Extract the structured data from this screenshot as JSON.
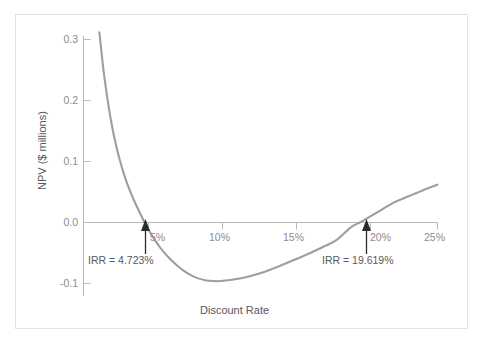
{
  "chart_data": {
    "type": "line",
    "title": "",
    "subtitle": "",
    "xlabel": "Discount Rate",
    "ylabel": "NPV ($ millions)",
    "xlim": [
      1.5,
      25
    ],
    "ylim": [
      -0.12,
      0.32
    ],
    "xticks": [
      5,
      10,
      15,
      20,
      25
    ],
    "xtick_labels": [
      "5%",
      "10%",
      "15%",
      "20%",
      "25%"
    ],
    "yticks": [
      -0.1,
      0.0,
      0.1,
      0.2,
      0.3
    ],
    "ytick_labels": [
      "-0.1",
      "0.0",
      "0.1",
      "0.2",
      "0.3"
    ],
    "grid": false,
    "legend": null,
    "series": [
      {
        "name": "NPV profile",
        "color": "#a59aa0",
        "x": [
          1.6,
          1.9,
          2.2,
          2.5,
          2.8,
          3.1,
          3.4,
          3.7,
          4.0,
          4.3,
          4.723,
          5.0,
          5.5,
          6.0,
          6.5,
          7.0,
          7.5,
          8.0,
          8.5,
          9.0,
          9.5,
          10.0,
          11.0,
          12.0,
          13.0,
          14.0,
          15.0,
          16.0,
          17.0,
          18.0,
          19.0,
          19.619,
          20.0,
          21.0,
          22.0,
          23.0,
          24.0,
          25.0
        ],
        "y": [
          0.312,
          0.247,
          0.196,
          0.155,
          0.122,
          0.095,
          0.072,
          0.053,
          0.036,
          0.021,
          0.0,
          -0.012,
          -0.031,
          -0.047,
          -0.06,
          -0.071,
          -0.08,
          -0.087,
          -0.092,
          -0.095,
          -0.096,
          -0.096,
          -0.093,
          -0.088,
          -0.081,
          -0.072,
          -0.062,
          -0.052,
          -0.041,
          -0.029,
          -0.008,
          0.0,
          0.005,
          0.019,
          0.033,
          0.043,
          0.053,
          0.062
        ]
      }
    ],
    "annotations": [
      {
        "id": "irr-low",
        "text": "IRR = 4.723%",
        "x": 4.723,
        "y": 0.0,
        "arrow": true
      },
      {
        "id": "irr-high",
        "text": "IRR = 19.619%",
        "x": 19.619,
        "y": 0.0,
        "arrow": true
      }
    ],
    "zero_line": {
      "y": 0.0,
      "color": "#b9b9bd"
    },
    "axis_color": "#b9b9bd",
    "frame_color": "#e2e2e4",
    "background": "#ffffff"
  }
}
